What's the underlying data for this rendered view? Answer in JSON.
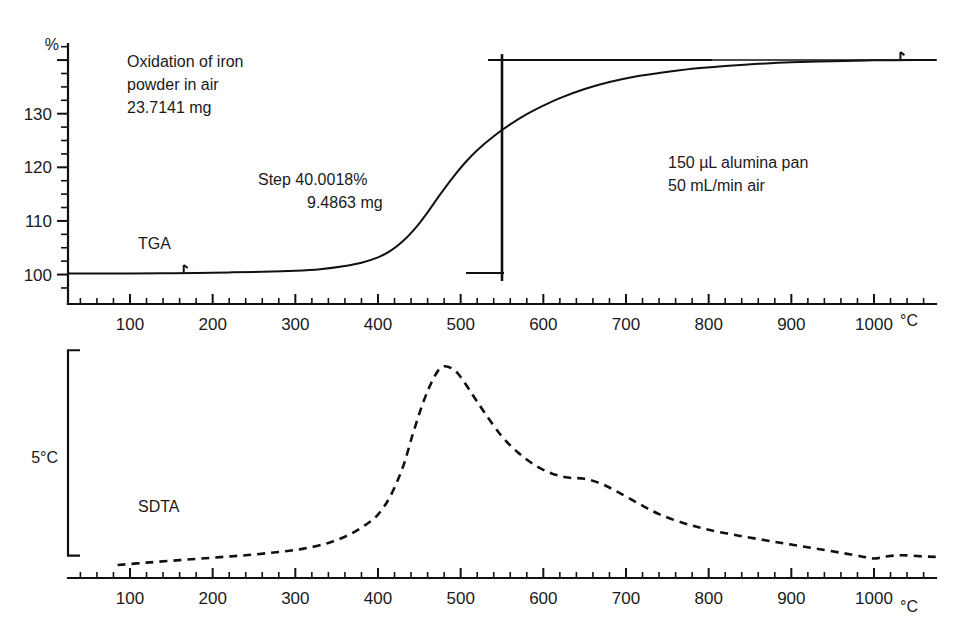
{
  "figure": {
    "title_block": {
      "line1": "Oxidation of iron",
      "line2": "powder in air",
      "line3": "23.7141 mg"
    },
    "step_annotation": {
      "line1": "Step 40.0018%",
      "line2": "9.4863 mg"
    },
    "conditions": {
      "line1": "150 µL alumina pan",
      "line2": "50 mL/min air"
    },
    "sdta_scale_label": "5°C",
    "ink_color": "#111111",
    "background_color": "#ffffff"
  },
  "chart_data": [
    {
      "type": "line",
      "name": "TGA",
      "title": "Oxidation of iron powder in air",
      "series_label": "TGA",
      "xlabel": "°C",
      "ylabel": "%",
      "xlim": [
        25,
        1075
      ],
      "ylim": [
        96,
        143
      ],
      "grid": false,
      "legend": "inline-label",
      "x_ticks_major": [
        100,
        200,
        300,
        400,
        500,
        600,
        700,
        800,
        900,
        1000
      ],
      "x_tick_labels": [
        "100",
        "200",
        "300",
        "400",
        "500",
        "600",
        "700",
        "800",
        "900",
        "1000"
      ],
      "x_minor_interval": 20,
      "y_ticks_major": [
        100,
        110,
        120,
        130,
        140
      ],
      "y_tick_labels": [
        "100",
        "110",
        "120",
        "130",
        ""
      ],
      "y_minor_interval": 2.5,
      "annotations": [
        {
          "text": "Step 40.0018%",
          "x": 330,
          "y": 121
        },
        {
          "text": "9.4863 mg",
          "x": 375,
          "y": 117
        },
        {
          "text": "150 µL alumina pan",
          "x": 720,
          "y": 122
        },
        {
          "text": "50 mL/min air",
          "x": 700,
          "y": 119
        },
        {
          "text": "TGA",
          "x": 155,
          "y": 105
        }
      ],
      "step_marker": {
        "x": 550,
        "y_low": 100.3,
        "y_high": 140.0,
        "step_percent": 40.0018,
        "step_mg": 9.4863
      },
      "reference_level": 140.0,
      "x": [
        25,
        60,
        100,
        140,
        180,
        220,
        260,
        300,
        330,
        360,
        380,
        400,
        415,
        430,
        445,
        460,
        475,
        490,
        505,
        520,
        540,
        560,
        580,
        600,
        620,
        650,
        680,
        710,
        740,
        780,
        820,
        860,
        900,
        950,
        1000,
        1050,
        1075
      ],
      "y": [
        100.2,
        100.2,
        100.2,
        100.25,
        100.3,
        100.4,
        100.5,
        100.7,
        101.0,
        101.6,
        102.2,
        103.2,
        104.4,
        106.2,
        108.6,
        111.6,
        114.9,
        118.0,
        120.8,
        123.2,
        125.8,
        128.0,
        129.9,
        131.5,
        132.9,
        134.6,
        135.9,
        136.9,
        137.6,
        138.4,
        138.9,
        139.3,
        139.6,
        139.8,
        139.95,
        140.0,
        140.0
      ]
    },
    {
      "type": "line",
      "name": "SDTA",
      "series_label": "SDTA",
      "xlabel": "°C",
      "ylabel": "5°C",
      "xlim": [
        25,
        1075
      ],
      "ylim": [
        0,
        5.6
      ],
      "grid": false,
      "style": "dashed",
      "legend": "inline-label",
      "x_ticks_major": [
        100,
        200,
        300,
        400,
        500,
        600,
        700,
        800,
        900,
        1000
      ],
      "x_tick_labels": [
        "100",
        "200",
        "300",
        "400",
        "500",
        "600",
        "700",
        "800",
        "900",
        "1000"
      ],
      "x_minor_interval": 20,
      "scale_bracket": {
        "label": "5°C",
        "span_degrees": 5
      },
      "annotations": [
        {
          "text": "SDTA",
          "x": 175,
          "y": 0.95
        }
      ],
      "x": [
        85,
        120,
        160,
        200,
        240,
        280,
        310,
        340,
        365,
        385,
        400,
        415,
        430,
        442,
        455,
        468,
        478,
        490,
        500,
        515,
        530,
        550,
        570,
        590,
        610,
        630,
        650,
        670,
        690,
        715,
        740,
        770,
        800,
        835,
        870,
        900,
        930,
        960,
        985,
        1000,
        1015,
        1035,
        1060,
        1075
      ],
      "y": [
        0.12,
        0.18,
        0.24,
        0.3,
        0.36,
        0.44,
        0.52,
        0.66,
        0.86,
        1.1,
        1.35,
        1.8,
        2.5,
        3.3,
        4.1,
        4.7,
        4.95,
        4.9,
        4.7,
        4.25,
        3.8,
        3.25,
        2.85,
        2.55,
        2.35,
        2.25,
        2.22,
        2.1,
        1.9,
        1.62,
        1.36,
        1.14,
        0.98,
        0.84,
        0.72,
        0.62,
        0.52,
        0.42,
        0.33,
        0.28,
        0.33,
        0.36,
        0.33,
        0.32
      ]
    }
  ]
}
